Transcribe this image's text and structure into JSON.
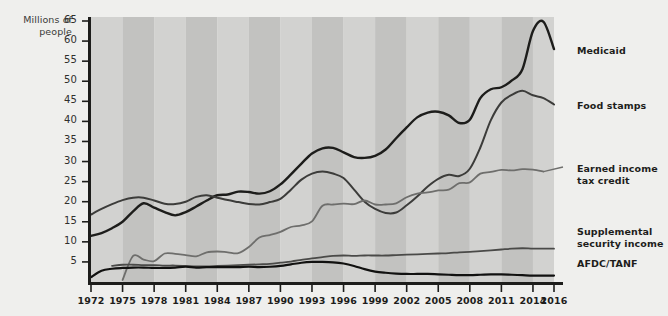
{
  "chart_data": {
    "type": "line",
    "title": "",
    "subtitle": "",
    "ylabel": "Millions\nof people",
    "xlabel": "",
    "ylim": [
      0,
      65
    ],
    "xlim": [
      1972,
      2016
    ],
    "grid": false,
    "legend_position": "right-of-plot-at-line-end",
    "background": "alternating vertical gray bands every 3 years",
    "colors": {
      "page_background": "#efefed",
      "plot_band_light": "#d2d2d0",
      "plot_band_dark": "#c2c2c0",
      "axis": "#1d1d1b",
      "medicaid": "#1d1d1b",
      "food_stamps": "#3c3c3a",
      "earned_income_tax_credit": "#6e6e6c",
      "supplemental_security_income": "#4a4a48",
      "afdc_tanf": "#111110"
    },
    "yticks": [
      5,
      10,
      15,
      20,
      25,
      30,
      35,
      40,
      45,
      50,
      55,
      60,
      65
    ],
    "ytick_labels": [
      "5",
      "10",
      "15",
      "20",
      "25",
      "30",
      "35",
      "40",
      "45",
      "50",
      "55",
      "60",
      "65"
    ],
    "xticks": [
      1972,
      1975,
      1978,
      1981,
      1984,
      1987,
      1990,
      1993,
      1996,
      1999,
      2002,
      2005,
      2008,
      2011,
      2014,
      2016
    ],
    "xtick_labels": [
      "1972",
      "1975",
      "1978",
      "1981",
      "1984",
      "1987",
      "1990",
      "1993",
      "1996",
      "1999",
      "2002",
      "2005",
      "2008",
      "2011",
      "2014",
      "2016"
    ],
    "series": [
      {
        "name": "Medicaid",
        "label": "Medicaid",
        "color": "#1d1d1b",
        "width": 2.4,
        "label_y": 45,
        "points": [
          [
            1972,
            11.5
          ],
          [
            1973,
            12.2
          ],
          [
            1974,
            13.4
          ],
          [
            1975,
            15.0
          ],
          [
            1976,
            17.6
          ],
          [
            1977,
            19.6
          ],
          [
            1978,
            18.5
          ],
          [
            1979,
            17.4
          ],
          [
            1980,
            16.6
          ],
          [
            1981,
            17.4
          ],
          [
            1982,
            18.8
          ],
          [
            1983,
            20.3
          ],
          [
            1984,
            21.6
          ],
          [
            1985,
            21.8
          ],
          [
            1986,
            22.5
          ],
          [
            1987,
            22.4
          ],
          [
            1988,
            22.0
          ],
          [
            1989,
            22.6
          ],
          [
            1990,
            24.3
          ],
          [
            1991,
            26.8
          ],
          [
            1992,
            29.5
          ],
          [
            1993,
            32.0
          ],
          [
            1994,
            33.3
          ],
          [
            1995,
            33.4
          ],
          [
            1996,
            32.3
          ],
          [
            1997,
            31.1
          ],
          [
            1998,
            30.9
          ],
          [
            1999,
            31.4
          ],
          [
            2000,
            33.0
          ],
          [
            2001,
            35.8
          ],
          [
            2002,
            38.5
          ],
          [
            2003,
            41.0
          ],
          [
            2004,
            42.2
          ],
          [
            2005,
            42.4
          ],
          [
            2006,
            41.5
          ],
          [
            2007,
            39.6
          ],
          [
            2008,
            40.4
          ],
          [
            2009,
            45.8
          ],
          [
            2010,
            48.0
          ],
          [
            2011,
            48.5
          ],
          [
            2012,
            50.2
          ],
          [
            2013,
            53.0
          ],
          [
            2014,
            62.5
          ],
          [
            2015,
            64.8
          ],
          [
            2016,
            58.0
          ]
        ]
      },
      {
        "name": "Food stamps",
        "label": "Food stamps",
        "color": "#3c3c3a",
        "width": 2.0,
        "label_y": 100,
        "points": [
          [
            1972,
            16.8
          ],
          [
            1973,
            18.2
          ],
          [
            1974,
            19.4
          ],
          [
            1975,
            20.4
          ],
          [
            1976,
            21.0
          ],
          [
            1977,
            21.0
          ],
          [
            1978,
            20.3
          ],
          [
            1979,
            19.5
          ],
          [
            1980,
            19.4
          ],
          [
            1981,
            20.0
          ],
          [
            1982,
            21.2
          ],
          [
            1983,
            21.6
          ],
          [
            1984,
            21.0
          ],
          [
            1985,
            20.4
          ],
          [
            1986,
            19.9
          ],
          [
            1987,
            19.4
          ],
          [
            1988,
            19.3
          ],
          [
            1989,
            19.9
          ],
          [
            1990,
            20.7
          ],
          [
            1991,
            23.0
          ],
          [
            1992,
            25.5
          ],
          [
            1993,
            27.0
          ],
          [
            1994,
            27.5
          ],
          [
            1995,
            27.0
          ],
          [
            1996,
            25.9
          ],
          [
            1997,
            23.0
          ],
          [
            1998,
            20.0
          ],
          [
            1999,
            18.2
          ],
          [
            2000,
            17.2
          ],
          [
            2001,
            17.3
          ],
          [
            2002,
            19.1
          ],
          [
            2003,
            21.3
          ],
          [
            2004,
            23.8
          ],
          [
            2005,
            25.7
          ],
          [
            2006,
            26.7
          ],
          [
            2007,
            26.4
          ],
          [
            2008,
            28.2
          ],
          [
            2009,
            33.5
          ],
          [
            2010,
            40.3
          ],
          [
            2011,
            44.7
          ],
          [
            2012,
            46.6
          ],
          [
            2013,
            47.6
          ],
          [
            2014,
            46.5
          ],
          [
            2015,
            45.8
          ],
          [
            2016,
            44.2
          ]
        ]
      },
      {
        "name": "Earned income tax credit",
        "label": "Earned income\ntax credit",
        "color": "#6e6e6c",
        "width": 1.8,
        "label_y": 163,
        "points": [
          [
            1975,
            0.5
          ],
          [
            1976,
            6.5
          ],
          [
            1977,
            5.6
          ],
          [
            1978,
            5.2
          ],
          [
            1979,
            7.1
          ],
          [
            1980,
            7.0
          ],
          [
            1981,
            6.7
          ],
          [
            1982,
            6.4
          ],
          [
            1983,
            7.4
          ],
          [
            1984,
            7.6
          ],
          [
            1985,
            7.4
          ],
          [
            1986,
            7.2
          ],
          [
            1987,
            8.7
          ],
          [
            1988,
            11.1
          ],
          [
            1989,
            11.7
          ],
          [
            1990,
            12.5
          ],
          [
            1991,
            13.7
          ],
          [
            1992,
            14.1
          ],
          [
            1993,
            15.1
          ],
          [
            1994,
            19.0
          ],
          [
            1995,
            19.3
          ],
          [
            1996,
            19.5
          ],
          [
            1997,
            19.4
          ],
          [
            1998,
            20.3
          ],
          [
            1999,
            19.3
          ],
          [
            2000,
            19.3
          ],
          [
            2001,
            19.6
          ],
          [
            2002,
            21.1
          ],
          [
            2003,
            22.0
          ],
          [
            2004,
            22.3
          ],
          [
            2005,
            22.8
          ],
          [
            2006,
            23.0
          ],
          [
            2007,
            24.6
          ],
          [
            2008,
            24.8
          ],
          [
            2009,
            27.0
          ],
          [
            2010,
            27.4
          ],
          [
            2011,
            27.9
          ],
          [
            2012,
            27.8
          ],
          [
            2013,
            28.1
          ],
          [
            2014,
            28.0
          ],
          [
            2015,
            27.5
          ]
        ]
      },
      {
        "name": "Supplemental security income",
        "label": "Supplemental\nsecurity income",
        "color": "#4a4a48",
        "width": 1.8,
        "label_y": 226,
        "points": [
          [
            1974,
            4.0
          ],
          [
            1975,
            4.3
          ],
          [
            1976,
            4.3
          ],
          [
            1977,
            4.2
          ],
          [
            1978,
            4.2
          ],
          [
            1979,
            4.1
          ],
          [
            1980,
            4.1
          ],
          [
            1981,
            4.0
          ],
          [
            1982,
            3.9
          ],
          [
            1983,
            3.9
          ],
          [
            1984,
            4.0
          ],
          [
            1985,
            4.1
          ],
          [
            1986,
            4.2
          ],
          [
            1987,
            4.3
          ],
          [
            1988,
            4.4
          ],
          [
            1989,
            4.5
          ],
          [
            1990,
            4.8
          ],
          [
            1991,
            5.1
          ],
          [
            1992,
            5.5
          ],
          [
            1993,
            5.9
          ],
          [
            1994,
            6.2
          ],
          [
            1995,
            6.5
          ],
          [
            1996,
            6.6
          ],
          [
            1997,
            6.5
          ],
          [
            1998,
            6.6
          ],
          [
            1999,
            6.6
          ],
          [
            2000,
            6.6
          ],
          [
            2001,
            6.7
          ],
          [
            2002,
            6.8
          ],
          [
            2003,
            6.9
          ],
          [
            2004,
            7.0
          ],
          [
            2005,
            7.1
          ],
          [
            2006,
            7.2
          ],
          [
            2007,
            7.4
          ],
          [
            2008,
            7.5
          ],
          [
            2009,
            7.7
          ],
          [
            2010,
            7.9
          ],
          [
            2011,
            8.1
          ],
          [
            2012,
            8.3
          ],
          [
            2013,
            8.4
          ],
          [
            2014,
            8.3
          ],
          [
            2015,
            8.3
          ],
          [
            2016,
            8.3
          ]
        ]
      },
      {
        "name": "AFDC/TANF",
        "label": "AFDC/TANF",
        "color": "#111110",
        "width": 2.2,
        "label_y": 258,
        "points": [
          [
            1972,
            1.2
          ],
          [
            1973,
            2.8
          ],
          [
            1974,
            3.3
          ],
          [
            1975,
            3.5
          ],
          [
            1976,
            3.6
          ],
          [
            1977,
            3.6
          ],
          [
            1978,
            3.5
          ],
          [
            1979,
            3.5
          ],
          [
            1980,
            3.6
          ],
          [
            1981,
            3.8
          ],
          [
            1982,
            3.6
          ],
          [
            1983,
            3.7
          ],
          [
            1984,
            3.7
          ],
          [
            1985,
            3.7
          ],
          [
            1986,
            3.7
          ],
          [
            1987,
            3.8
          ],
          [
            1988,
            3.7
          ],
          [
            1989,
            3.8
          ],
          [
            1990,
            4.0
          ],
          [
            1991,
            4.4
          ],
          [
            1992,
            4.8
          ],
          [
            1993,
            5.0
          ],
          [
            1994,
            5.0
          ],
          [
            1995,
            4.9
          ],
          [
            1996,
            4.6
          ],
          [
            1997,
            4.0
          ],
          [
            1998,
            3.2
          ],
          [
            1999,
            2.6
          ],
          [
            2000,
            2.3
          ],
          [
            2001,
            2.1
          ],
          [
            2002,
            2.0
          ],
          [
            2003,
            2.0
          ],
          [
            2004,
            2.0
          ],
          [
            2005,
            1.9
          ],
          [
            2006,
            1.8
          ],
          [
            2007,
            1.7
          ],
          [
            2008,
            1.7
          ],
          [
            2009,
            1.8
          ],
          [
            2010,
            1.9
          ],
          [
            2011,
            1.9
          ],
          [
            2012,
            1.8
          ],
          [
            2013,
            1.7
          ],
          [
            2014,
            1.6
          ],
          [
            2015,
            1.6
          ],
          [
            2016,
            1.6
          ]
        ]
      }
    ]
  },
  "axis": {
    "y_title": "Millions\nof people"
  }
}
